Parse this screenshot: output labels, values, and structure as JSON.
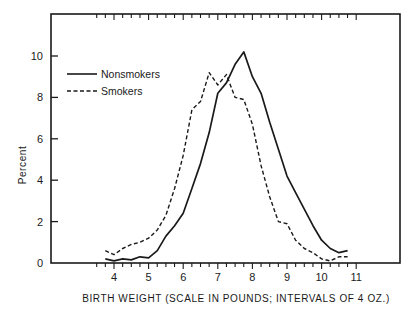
{
  "chart_data": {
    "type": "line",
    "title": "",
    "xlabel": "BIRTH WEIGHT (SCALE IN POUNDS; INTERVALS OF 4 OZ.)",
    "ylabel": "Percent",
    "xlim": [
      3.0,
      12.5
    ],
    "ylim": [
      0,
      12
    ],
    "x_ticks": [
      4,
      5,
      6,
      7,
      8,
      9,
      10,
      11
    ],
    "y_ticks": [
      0,
      2,
      4,
      6,
      8,
      10
    ],
    "x_minor_interval": 0.25,
    "grid": false,
    "legend_position": "upper left",
    "x": [
      3.75,
      4.0,
      4.25,
      4.5,
      4.75,
      5.0,
      5.25,
      5.5,
      5.75,
      6.0,
      6.25,
      6.5,
      6.75,
      7.0,
      7.25,
      7.5,
      7.75,
      8.0,
      8.25,
      8.5,
      8.75,
      9.0,
      9.25,
      9.5,
      9.75,
      10.0,
      10.25,
      10.5,
      10.75
    ],
    "series": [
      {
        "name": "Nonsmokers",
        "style": "solid",
        "values": [
          0.2,
          0.1,
          0.2,
          0.15,
          0.3,
          0.25,
          0.6,
          1.3,
          1.8,
          2.4,
          3.6,
          4.8,
          6.3,
          8.2,
          8.7,
          9.6,
          10.2,
          9.0,
          8.2,
          6.8,
          5.5,
          4.2,
          3.4,
          2.6,
          1.8,
          1.1,
          0.7,
          0.5,
          0.6
        ]
      },
      {
        "name": "Smokers",
        "style": "dashed",
        "values": [
          0.6,
          0.4,
          0.7,
          0.9,
          1.0,
          1.2,
          1.6,
          2.3,
          3.6,
          5.2,
          7.4,
          7.8,
          9.2,
          8.6,
          9.1,
          8.0,
          7.9,
          6.7,
          4.7,
          3.2,
          2.0,
          1.9,
          1.1,
          0.7,
          0.5,
          0.2,
          0.1,
          0.3,
          0.3
        ]
      }
    ]
  },
  "legend": {
    "items": [
      {
        "label": "Nonsmokers",
        "style": "solid"
      },
      {
        "label": "Smokers",
        "style": "dashed"
      }
    ]
  },
  "colors": {
    "ink": "#1a1a1a",
    "background": "#ffffff"
  }
}
